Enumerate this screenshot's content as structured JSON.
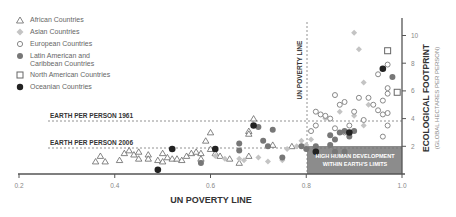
{
  "chart_data": {
    "type": "scatter",
    "title": "",
    "xlabel": "UN POVERTY LINE",
    "ylabel": "ECOLOGICAL FOOTPRINT",
    "ylabel_sub": "(GLOBAL HECTARES PER PERSON)",
    "xlim": [
      0.2,
      1.0
    ],
    "ylim": [
      0,
      11
    ],
    "x_ticks": [
      "0.2",
      "0.4",
      "0.6",
      "0.8",
      "1.0"
    ],
    "y_ticks": [
      "2",
      "4",
      "6",
      "8",
      "10"
    ],
    "annotations": {
      "vline_label": "UN POVERTY LINE",
      "vline_x": 0.8,
      "hline_1961_label": "EARTH PER PERSON 1961",
      "hline_1961_y": 3.8,
      "hline_2006_label": "EARTH PER PERSON 2006",
      "hline_2006_y": 1.8,
      "box_label_1": "HIGH HUMAN DEVELOPMENT",
      "box_label_2": "WITHIN EARTH'S LIMITS"
    },
    "legend": [
      {
        "name": "African Countries",
        "symbol": "triangle-open"
      },
      {
        "name": "Asian Countries",
        "symbol": "diamond-light"
      },
      {
        "name": "European Countries",
        "symbol": "circle-open"
      },
      {
        "name": "Latin American and Caribbean Countries",
        "symbol": "circle-mid"
      },
      {
        "name": "North American Countries",
        "symbol": "square-open"
      },
      {
        "name": "Oceanian Countries",
        "symbol": "circle-dark"
      }
    ],
    "series": [
      {
        "name": "African Countries",
        "points": [
          [
            0.37,
            1.3
          ],
          [
            0.36,
            0.9
          ],
          [
            0.38,
            0.9
          ],
          [
            0.41,
            1.0
          ],
          [
            0.43,
            1.7
          ],
          [
            0.44,
            1.4
          ],
          [
            0.45,
            1.1
          ],
          [
            0.47,
            1.4
          ],
          [
            0.47,
            1.1
          ],
          [
            0.49,
            1.0
          ],
          [
            0.5,
            0.9
          ],
          [
            0.51,
            1.2
          ],
          [
            0.52,
            1.1
          ],
          [
            0.53,
            1.1
          ],
          [
            0.54,
            1.0
          ],
          [
            0.55,
            1.3
          ],
          [
            0.56,
            1.5
          ],
          [
            0.57,
            1.6
          ],
          [
            0.58,
            1.1
          ],
          [
            0.58,
            1.5
          ],
          [
            0.59,
            2.4
          ],
          [
            0.6,
            3.0
          ],
          [
            0.6,
            1.8
          ],
          [
            0.61,
            1.5
          ],
          [
            0.64,
            1.1
          ],
          [
            0.66,
            0.8
          ],
          [
            0.5,
            1.5
          ],
          [
            0.45,
            1.6
          ],
          [
            0.42,
            1.5
          ],
          [
            0.68,
            1.3
          ],
          [
            0.68,
            3.1
          ],
          [
            0.68,
            2.9
          ],
          [
            0.69,
            4.0
          ],
          [
            0.73,
            2.1
          ],
          [
            0.77,
            2.0
          ],
          [
            0.62,
            1.3
          ]
        ]
      },
      {
        "name": "Asian Countries",
        "points": [
          [
            0.61,
            1.3
          ],
          [
            0.63,
            1.1
          ],
          [
            0.66,
            1.1
          ],
          [
            0.67,
            1.0
          ],
          [
            0.7,
            1.2
          ],
          [
            0.72,
            0.9
          ],
          [
            0.75,
            1.0
          ],
          [
            0.76,
            1.8
          ],
          [
            0.78,
            2.0
          ],
          [
            0.79,
            2.4
          ],
          [
            0.8,
            2.1
          ],
          [
            0.82,
            3.5
          ],
          [
            0.84,
            4.0
          ],
          [
            0.87,
            4.5
          ],
          [
            0.9,
            4.2
          ],
          [
            0.92,
            3.5
          ],
          [
            0.93,
            5.0
          ],
          [
            0.9,
            10.2
          ],
          [
            0.91,
            9.0
          ],
          [
            0.92,
            6.6
          ],
          [
            0.81,
            2.5
          ]
        ]
      },
      {
        "name": "European Countries",
        "points": [
          [
            0.81,
            3.1
          ],
          [
            0.82,
            4.5
          ],
          [
            0.83,
            4.3
          ],
          [
            0.85,
            4.0
          ],
          [
            0.86,
            3.3
          ],
          [
            0.87,
            5.0
          ],
          [
            0.88,
            3.0
          ],
          [
            0.89,
            3.5
          ],
          [
            0.9,
            4.5
          ],
          [
            0.92,
            3.9
          ],
          [
            0.93,
            5.5
          ],
          [
            0.94,
            5.0
          ],
          [
            0.95,
            4.6
          ],
          [
            0.96,
            4.3
          ],
          [
            0.96,
            5.3
          ],
          [
            0.97,
            5.8
          ],
          [
            0.97,
            6.2
          ],
          [
            0.97,
            4.4
          ],
          [
            0.97,
            3.5
          ],
          [
            0.96,
            2.7
          ],
          [
            0.95,
            7.2
          ],
          [
            0.97,
            7.9
          ],
          [
            0.88,
            5.2
          ],
          [
            0.91,
            5.5
          ],
          [
            0.86,
            5.7
          ],
          [
            0.84,
            4.2
          ],
          [
            0.82,
            3.5
          ]
        ]
      },
      {
        "name": "Latin American and Caribbean Countries",
        "points": [
          [
            0.58,
            0.8
          ],
          [
            0.66,
            2.2
          ],
          [
            0.66,
            1.7
          ],
          [
            0.71,
            2.4
          ],
          [
            0.72,
            2.0
          ],
          [
            0.7,
            3.4
          ],
          [
            0.73,
            3.2
          ],
          [
            0.75,
            1.2
          ],
          [
            0.79,
            2.0
          ],
          [
            0.8,
            1.8
          ],
          [
            0.82,
            2.0
          ],
          [
            0.85,
            2.8
          ],
          [
            0.86,
            2.5
          ],
          [
            0.87,
            3.0
          ],
          [
            0.88,
            3.1
          ],
          [
            0.89,
            2.7
          ],
          [
            0.9,
            3.1
          ],
          [
            0.85,
            2.1
          ],
          [
            0.86,
            1.6
          ],
          [
            0.88,
            1.6
          ],
          [
            0.98,
            7.0
          ]
        ]
      },
      {
        "name": "North American Countries",
        "points": [
          [
            0.97,
            8.9
          ],
          [
            0.99,
            5.9
          ]
        ]
      },
      {
        "name": "Oceanian Countries",
        "points": [
          [
            0.52,
            1.8
          ],
          [
            0.49,
            0.3
          ],
          [
            0.61,
            1.8
          ],
          [
            0.69,
            3.5
          ],
          [
            0.96,
            7.6
          ],
          [
            0.89,
            3.0
          ],
          [
            0.82,
            1.6
          ]
        ]
      }
    ]
  },
  "colors": {
    "axis": "#555555",
    "text": "#333333",
    "muted": "#888888",
    "box": "#8c8c8c",
    "triangle": "#666666",
    "diamond": "#c4c4c4",
    "circle_open": "#888888",
    "circle_mid": "#777777",
    "circle_dark": "#222222"
  }
}
